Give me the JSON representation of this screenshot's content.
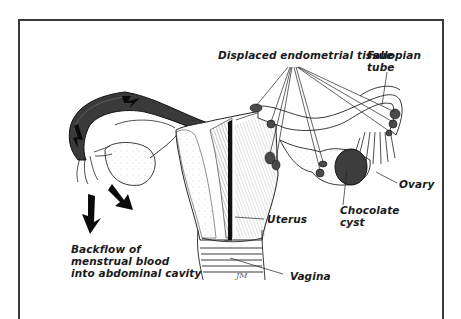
{
  "figure": {
    "labels": {
      "displaced_tissue": "Displaced endometrial tissue",
      "fallopian_tube_line1": "Fallopian",
      "fallopian_tube_line2": "tube",
      "ovary": "Ovary",
      "chocolate_cyst_line1": "Chocolate",
      "chocolate_cyst_line2": "cyst",
      "uterus": "Uterus",
      "vagina": "Vagina",
      "backflow_line1": "Backflow of",
      "backflow_line2": "menstrual blood",
      "backflow_line3": "into abdominal cavity"
    },
    "signature": "JM"
  }
}
